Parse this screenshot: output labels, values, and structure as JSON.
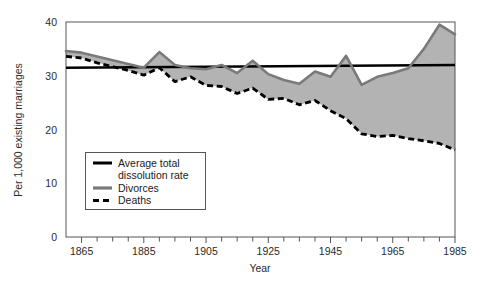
{
  "chart_data": {
    "type": "area",
    "title": "",
    "xlabel": "Year",
    "ylabel": "Per 1,000 existing marriages",
    "xlim": [
      1860,
      1985
    ],
    "ylim": [
      0,
      40
    ],
    "xticks_major": [
      1865,
      1885,
      1905,
      1925,
      1945,
      1965,
      1985
    ],
    "xtick_labels": [
      "1865",
      "1885",
      "1905",
      "1925",
      "1945",
      "1965",
      "1985"
    ],
    "xtick_minor_step": 5,
    "yticks": [
      0,
      10,
      20,
      30,
      40
    ],
    "ytick_labels": [
      "0",
      "10",
      "20",
      "30",
      "40"
    ],
    "grid": false,
    "legend_position": "inside-lower-left",
    "fill_note": "gray band between Divorces (upper) and Deaths (lower)",
    "colors": {
      "divorces_line": "#7a7a7a",
      "deaths_line": "#000000",
      "average_line": "#000000",
      "band_fill": "#b3b3b3",
      "frame": "#555555",
      "background": "#ffffff"
    },
    "series": [
      {
        "name": "Average total dissolution rate",
        "style": "solid-thick-black",
        "x": [
          1860,
          1985
        ],
        "values": [
          31.5,
          32.0
        ]
      },
      {
        "name": "Divorces",
        "style": "solid-thick-gray",
        "x": [
          1860,
          1865,
          1870,
          1875,
          1880,
          1885,
          1890,
          1895,
          1900,
          1905,
          1910,
          1915,
          1920,
          1925,
          1930,
          1935,
          1940,
          1945,
          1950,
          1955,
          1960,
          1965,
          1970,
          1975,
          1980,
          1985
        ],
        "values": [
          34.6,
          34.3,
          33.6,
          32.9,
          32.2,
          31.5,
          34.4,
          32.0,
          31.4,
          31.2,
          32.0,
          30.5,
          32.8,
          30.3,
          29.2,
          28.5,
          30.8,
          29.8,
          33.7,
          28.3,
          29.8,
          30.5,
          31.4,
          35.0,
          39.5,
          37.7
        ]
      },
      {
        "name": "Deaths",
        "style": "dashed-thick-black",
        "x": [
          1860,
          1865,
          1870,
          1875,
          1880,
          1885,
          1890,
          1895,
          1900,
          1905,
          1910,
          1915,
          1920,
          1925,
          1930,
          1935,
          1940,
          1945,
          1950,
          1955,
          1960,
          1965,
          1970,
          1975,
          1980,
          1985
        ],
        "values": [
          33.6,
          33.3,
          32.4,
          31.7,
          31.0,
          30.1,
          31.5,
          28.9,
          29.8,
          28.2,
          28.0,
          26.7,
          27.7,
          25.6,
          25.8,
          24.6,
          25.4,
          23.5,
          22.0,
          19.2,
          18.7,
          18.9,
          18.3,
          17.9,
          17.4,
          16.2
        ]
      }
    ]
  },
  "legend": {
    "items": [
      {
        "label_line1": "Average total",
        "label_line2": "dissolution rate",
        "style": "solid-black"
      },
      {
        "label_line1": "Divorces",
        "label_line2": "",
        "style": "solid-gray"
      },
      {
        "label_line1": "Deaths",
        "label_line2": "",
        "style": "dashed-black"
      }
    ]
  },
  "axes": {
    "y_title": "Per 1,000 existing marriages",
    "x_title": "Year"
  }
}
